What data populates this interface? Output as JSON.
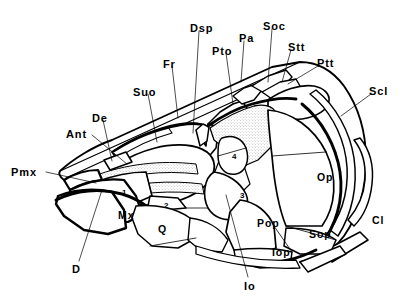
{
  "figure": {
    "type": "anatomical-line-drawing",
    "background_color": "#ffffff",
    "line_color": "#000000",
    "stipple_color": "#9a9a9a"
  },
  "callout_labels": [
    {
      "id": "pmx",
      "text": "Pmx",
      "x": 11,
      "y": 167,
      "leader": [
        [
          46,
          172
        ],
        [
          96,
          183
        ]
      ]
    },
    {
      "id": "ant",
      "text": "Ant",
      "x": 66,
      "y": 129,
      "leader": [
        [
          92,
          135
        ],
        [
          127,
          164
        ]
      ]
    },
    {
      "id": "de",
      "text": "De",
      "x": 92,
      "y": 113,
      "leader": [
        [
          103,
          120
        ],
        [
          112,
          161
        ]
      ]
    },
    {
      "id": "suo",
      "text": "Suo",
      "x": 133,
      "y": 87,
      "leader": [
        [
          148,
          94
        ],
        [
          157,
          142
        ]
      ]
    },
    {
      "id": "fr",
      "text": "Fr",
      "x": 163,
      "y": 59,
      "leader": [
        [
          172,
          66
        ],
        [
          178,
          118
        ]
      ]
    },
    {
      "id": "dsp",
      "text": "Dsp",
      "x": 190,
      "y": 23,
      "leader": [
        [
          199,
          31
        ],
        [
          193,
          133
        ]
      ]
    },
    {
      "id": "pto",
      "text": "Pto",
      "x": 212,
      "y": 46,
      "leader": [
        [
          226,
          53
        ],
        [
          233,
          104
        ]
      ]
    },
    {
      "id": "pa",
      "text": "Pa",
      "x": 239,
      "y": 33,
      "leader": [
        [
          244,
          41
        ],
        [
          241,
          82
        ]
      ]
    },
    {
      "id": "soc",
      "text": "Soc",
      "x": 263,
      "y": 21,
      "leader": [
        [
          272,
          29
        ],
        [
          268,
          82
        ]
      ]
    },
    {
      "id": "stt",
      "text": "Stt",
      "x": 288,
      "y": 42,
      "leader": [
        [
          291,
          50
        ],
        [
          282,
          82
        ]
      ]
    },
    {
      "id": "ptt",
      "text": "Ptt",
      "x": 317,
      "y": 58,
      "leader": [
        [
          318,
          66
        ],
        [
          288,
          84
        ]
      ]
    },
    {
      "id": "scl",
      "text": "Scl",
      "x": 369,
      "y": 86,
      "leader": [
        [
          371,
          94
        ],
        [
          341,
          116
        ]
      ]
    },
    {
      "id": "d",
      "text": "D",
      "x": 72,
      "y": 264,
      "leader": [
        [
          79,
          261
        ],
        [
          102,
          190
        ]
      ]
    },
    {
      "id": "io",
      "text": "Io",
      "x": 244,
      "y": 281,
      "leader": [
        [
          248,
          277
        ],
        [
          226,
          195
        ]
      ]
    }
  ],
  "bone_labels": [
    {
      "id": "mx",
      "text": "Mx",
      "x": 118,
      "y": 210
    },
    {
      "id": "q",
      "text": "Q",
      "x": 158,
      "y": 224
    },
    {
      "id": "pop",
      "text": "Pop",
      "x": 257,
      "y": 218
    },
    {
      "id": "sop",
      "text": "Sop",
      "x": 309,
      "y": 229
    },
    {
      "id": "iop",
      "text": "Iop",
      "x": 272,
      "y": 247
    },
    {
      "id": "op",
      "text": "Op",
      "x": 317,
      "y": 172
    },
    {
      "id": "cl",
      "text": "Cl",
      "x": 372,
      "y": 215
    }
  ],
  "numbered_infraorbitals": [
    {
      "id": "io1",
      "text": "1",
      "x": 122,
      "y": 189
    },
    {
      "id": "io2",
      "text": "2",
      "x": 164,
      "y": 202
    },
    {
      "id": "io3",
      "text": "3",
      "x": 240,
      "y": 192
    },
    {
      "id": "io4",
      "text": "4",
      "x": 232,
      "y": 153
    }
  ]
}
